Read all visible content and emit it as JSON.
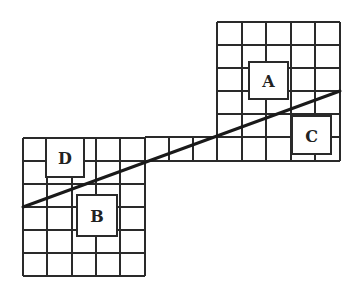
{
  "diagram": {
    "type": "grid-with-diagonal-line",
    "colors": {
      "background": "#ffffff",
      "grid_line": "#2a2a2a",
      "diagonal_line": "#1a1a1a",
      "box_fill": "#ffffff",
      "box_border": "#2a2a2a",
      "label": "#222222"
    },
    "grids": [
      {
        "name": "upper-right-grid",
        "x_lines": [
          217,
          242,
          266,
          291,
          315,
          340
        ],
        "y_lines": [
          22,
          45,
          68,
          91,
          114,
          137,
          161
        ]
      },
      {
        "name": "connector-strip",
        "x_lines": [
          145,
          169,
          193,
          217
        ],
        "y_lines": [
          137,
          161
        ]
      },
      {
        "name": "lower-left-grid",
        "x_lines": [
          23,
          47,
          72,
          96,
          120,
          145
        ],
        "y_lines": [
          138,
          161,
          184,
          207,
          230,
          253,
          276
        ]
      }
    ],
    "diagonal_line": {
      "x1": 23,
      "y1": 207,
      "x2": 340,
      "y2": 91
    },
    "boxes": [
      {
        "label": "A",
        "x": 249,
        "y": 62,
        "w": 39,
        "h": 37
      },
      {
        "label": "C",
        "x": 292,
        "y": 116,
        "w": 39,
        "h": 38
      },
      {
        "label": "D",
        "x": 46,
        "y": 138,
        "w": 38,
        "h": 39
      },
      {
        "label": "B",
        "x": 77,
        "y": 195,
        "w": 40,
        "h": 41
      }
    ]
  }
}
